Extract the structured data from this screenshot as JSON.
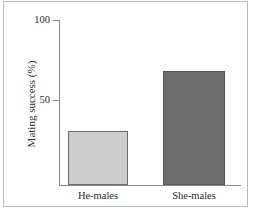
{
  "chart_data": {
    "type": "bar",
    "title": "",
    "subtitle": "",
    "categories": [
      "He-males",
      "She-males"
    ],
    "values": [
      33,
      69
    ],
    "xlabel": "",
    "ylabel": "Mating success (%)",
    "ylim": [
      0,
      100
    ],
    "ytick_labels": [
      "100",
      "50"
    ],
    "ytick_values": [
      100,
      50
    ],
    "grid": false,
    "legend": false,
    "bar_colors": [
      "#cdcdcd",
      "#6e6e6e"
    ],
    "bar_edge_colors": [
      "#6d6d6d",
      "#555555"
    ],
    "axis_color": "#8a8a8a",
    "frame_color": "#b9b9b9",
    "background": "#ffffff"
  },
  "axes": {
    "y_title": "Mating success (%)",
    "ticks": [
      {
        "label": "100",
        "value": 100
      },
      {
        "label": "50",
        "value": 50
      }
    ]
  },
  "bars": [
    {
      "label": "He-males",
      "value": 33
    },
    {
      "label": "She-males",
      "value": 69
    }
  ]
}
